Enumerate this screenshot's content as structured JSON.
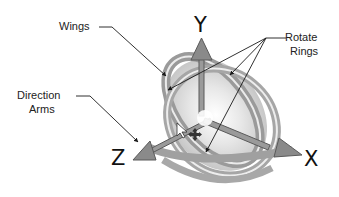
{
  "diagram": {
    "labels": {
      "wings": "Wings",
      "rotate_rings_line1": "Rotate",
      "rotate_rings_line2": "Rings",
      "direction_arms_line1": "Direction",
      "direction_arms_line2": "Arms"
    },
    "axes": {
      "y": "Y",
      "z": "Z",
      "x": "X"
    },
    "icons": [
      "cursor-arrow-icon",
      "move-cross-icon"
    ],
    "colors": {
      "ring_outer": "#9a9a9a",
      "ring_inner": "#b5b5b5",
      "wing_fill": "#c8c8c8",
      "arm_fill": "#8a8a8a",
      "leader_line": "#1a1a1a",
      "text": "#222222"
    }
  }
}
